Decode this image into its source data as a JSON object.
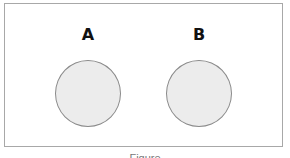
{
  "diagram": {
    "sets": [
      {
        "label": "A",
        "center_x": 88,
        "center_y": 94,
        "radius": 33,
        "fill": "#ececec",
        "stroke": "#8a8a8a"
      },
      {
        "label": "B",
        "center_x": 199,
        "center_y": 94,
        "radius": 33,
        "fill": "#ececec",
        "stroke": "#8a8a8a"
      }
    ],
    "frame_border": "#a8a8a8",
    "caption": "Figure"
  }
}
